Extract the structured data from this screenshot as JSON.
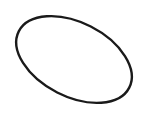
{
  "canvas": {
    "width": 143,
    "height": 122,
    "background": "#ffffff"
  },
  "shapes": [
    {
      "type": "ellipse",
      "cx": 74,
      "cy": 59.5,
      "rx": 62,
      "ry": 37,
      "rotation_deg": 27,
      "stroke": "#1a1a1a",
      "stroke_width": 2.4,
      "fill": "none"
    }
  ]
}
